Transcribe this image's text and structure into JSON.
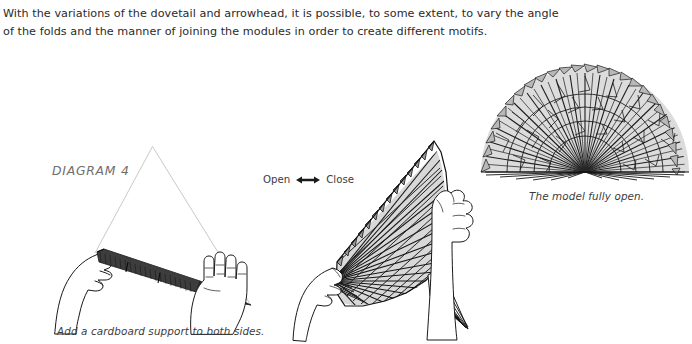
{
  "page": {
    "background_color": "#ffffff",
    "width": 692,
    "height": 344
  },
  "intro": {
    "line1": "With the variations of the dovetail and arrowhead, it is possible, to some extent, to vary the angle",
    "line2": "of the folds and the manner of joining the modules in order to create different motifs."
  },
  "diagram": {
    "label": "DIAGRAM 4",
    "label_color": "#6e6e6e"
  },
  "figures": {
    "left": {
      "name": "folded-model-in-hands",
      "caption": "Add a cardboard support to both sides.",
      "guide_color": "#c9c9c9",
      "paper_color": "#3a3a3a"
    },
    "middle": {
      "name": "partially-open-fan-in-hands",
      "open_label": "Open",
      "close_label": "Close",
      "arrow_icon": "double-headed-arrow-icon",
      "paper_fill": "#d8d8d8",
      "line_color": "#1a1a1a"
    },
    "right": {
      "name": "fully-open-fan",
      "caption": "The model fully open.",
      "paper_fill": "#d9d9d9",
      "line_color": "#1a1a1a"
    }
  },
  "colors": {
    "text": "#2a2a2a",
    "caption": "#3c3c3c",
    "ink": "#1a1a1a",
    "guide": "#c9c9c9"
  }
}
